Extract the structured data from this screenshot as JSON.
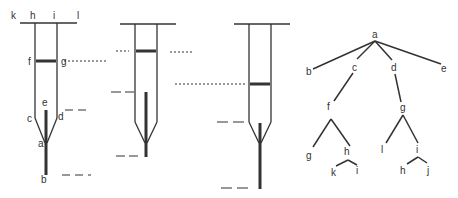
{
  "figure": {
    "syringe_1": {
      "labels": {
        "k": "k",
        "h": "h",
        "i": "i",
        "l": "l",
        "f": "f",
        "g": "g",
        "e": "e",
        "c": "c",
        "d": "d",
        "a": "a",
        "b": "b"
      }
    },
    "syringe_2": {},
    "syringe_3": {},
    "tree": {
      "nodes": {
        "a": "a",
        "b": "b",
        "c": "c",
        "d": "d",
        "e": "e",
        "f": "f",
        "g": "g",
        "fg": "g",
        "fh": "h",
        "hk": "k",
        "hi": "i",
        "gl": "l",
        "gi": "i",
        "ih": "h",
        "ij": "j"
      }
    }
  },
  "colors": {
    "ink": "#333333",
    "background": "#ffffff"
  }
}
